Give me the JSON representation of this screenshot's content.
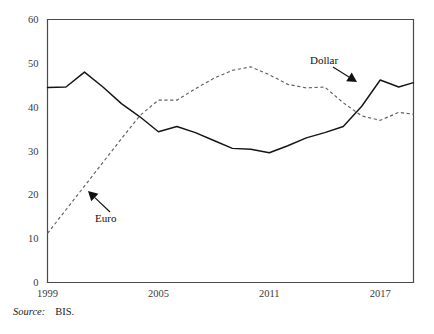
{
  "figure": {
    "source_label": "Source:",
    "source_value": "BIS."
  },
  "chart_data": {
    "type": "line",
    "title": "",
    "subtitle": "",
    "xlabel": "",
    "ylabel": "",
    "xlim": [
      1999,
      2018.8
    ],
    "ylim": [
      0,
      60
    ],
    "grid": false,
    "legend_position": "inline-annotations",
    "x_ticks": [
      1999,
      2005,
      2011,
      2017
    ],
    "x_tick_labels": [
      "1999",
      "2005",
      "2011",
      "2017"
    ],
    "y_ticks": [
      0,
      10,
      20,
      30,
      40,
      50,
      60
    ],
    "y_tick_labels": [
      "0",
      "10",
      "20",
      "30",
      "40",
      "50",
      "60"
    ],
    "x": [
      1999,
      2000,
      2001,
      2002,
      2003,
      2004,
      2005,
      2006,
      2007,
      2008,
      2009,
      2010,
      2011,
      2012,
      2013,
      2014,
      2015,
      2016,
      2017,
      2018,
      2018.8
    ],
    "series": [
      {
        "name": "Dollar",
        "style": "solid",
        "color": "#151515",
        "values": [
          44.5,
          44.6,
          48.0,
          44.6,
          40.8,
          37.8,
          34.4,
          35.6,
          34.2,
          32.4,
          30.6,
          30.4,
          29.6,
          31.2,
          33.0,
          34.2,
          35.6,
          40.2,
          46.2,
          44.6,
          45.6
        ]
      },
      {
        "name": "Euro",
        "style": "dashed",
        "color": "#606060",
        "values": [
          11.2,
          16.6,
          22.0,
          27.4,
          32.8,
          38.1,
          41.6,
          41.6,
          44.2,
          46.6,
          48.4,
          49.2,
          47.4,
          45.2,
          44.4,
          44.6,
          41.0,
          38.0,
          37.0,
          38.8,
          38.4
        ]
      }
    ],
    "annotations": [
      {
        "text": "Dollar",
        "series": "Dollar",
        "label_x": 310,
        "label_y": 64,
        "arrow_from_x": 333,
        "arrow_from_y": 67,
        "arrow_to_x": 357,
        "arrow_to_y": 82
      },
      {
        "text": "Euro",
        "series": "Euro",
        "label_x": 95,
        "label_y": 222,
        "arrow_from_x": 110,
        "arrow_from_y": 212,
        "arrow_to_x": 88,
        "arrow_to_y": 191
      }
    ]
  }
}
